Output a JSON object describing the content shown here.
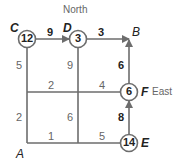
{
  "compass": {
    "north": "North",
    "east": "East"
  },
  "nodes": {
    "A": {
      "label": "A"
    },
    "B": {
      "label": "B"
    },
    "C": {
      "label": "C",
      "value": "12"
    },
    "D": {
      "label": "D",
      "value": "3"
    },
    "E": {
      "label": "E",
      "value": "14"
    },
    "F": {
      "label": "F",
      "value": "6"
    }
  },
  "edges": {
    "C_D": "9",
    "D_B": "3",
    "F_B": "6",
    "E_F": "8",
    "left_upper": "5",
    "left_lower": "2",
    "mid_upper": "9",
    "mid_lower": "6",
    "middle_left": "2",
    "middle_right": "4",
    "bottom_left": "1",
    "bottom_right": "5"
  },
  "colors": {
    "line": "#6d6d6d",
    "text_dark": "#222222",
    "text_gray": "#666666"
  }
}
